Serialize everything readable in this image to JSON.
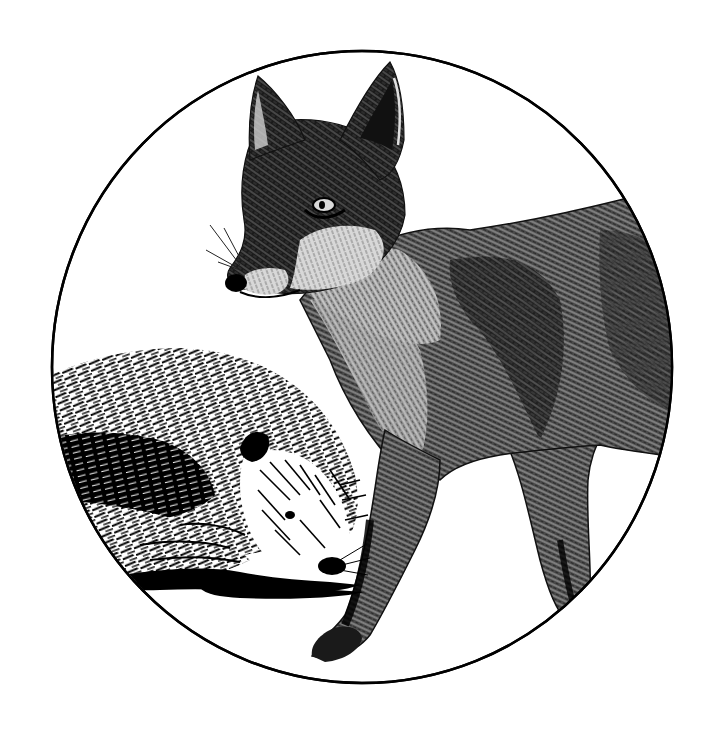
{
  "image": {
    "description": "Engraving-style black and white illustration of a red fox standing beside a hedgehog, framed within a circle",
    "background_color": "#ffffff",
    "ink_color": "#000000",
    "frame": {
      "shape": "circle",
      "cx": 362,
      "cy": 367,
      "rx": 310,
      "ry": 316,
      "stroke_width": 2.5
    },
    "subjects": [
      {
        "name": "fox",
        "pose": "standing, head turned toward viewer-left, looking down-left"
      },
      {
        "name": "hedgehog",
        "pose": "crouched low, facing right, snout near ground"
      }
    ]
  }
}
